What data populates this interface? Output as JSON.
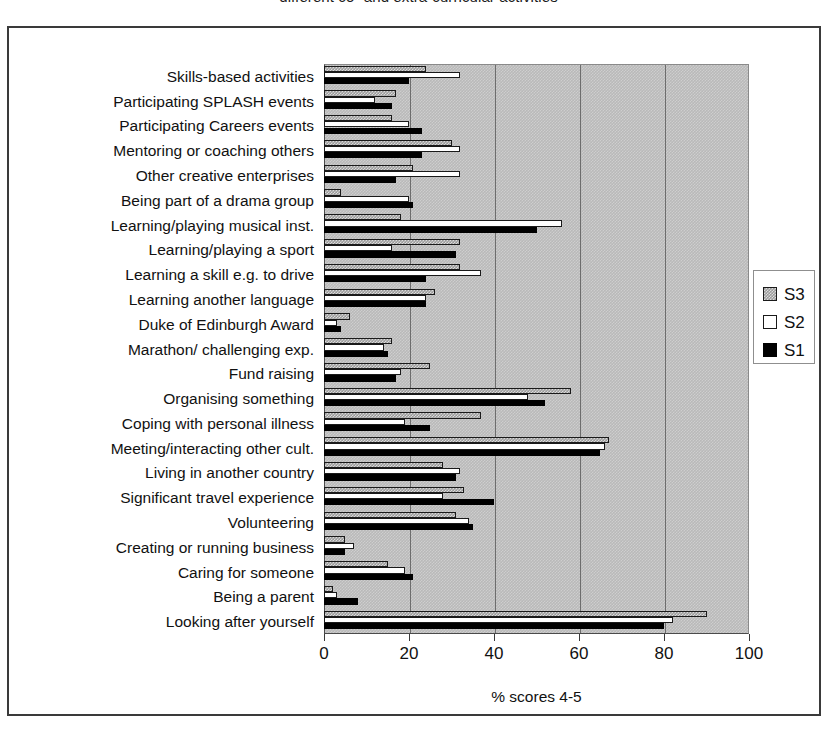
{
  "figure": {
    "title": "different co- and extra-curricular activities"
  },
  "chart_data": {
    "type": "bar",
    "orientation": "horizontal",
    "title": "different co- and extra-curricular activities",
    "xlabel": "% scores 4-5",
    "ylabel": "",
    "xlim": [
      0,
      100
    ],
    "xticks": [
      0,
      20,
      40,
      60,
      80,
      100
    ],
    "grid": "vertical gridlines at 20, 40, 60, 80",
    "legend_position": "right",
    "plot_background": "#b9b9b9",
    "categories": [
      "Skills-based activities",
      "Participating SPLASH events",
      "Participating Careers events",
      "Mentoring or coaching others",
      "Other creative enterprises",
      "Being part of a drama group",
      "Learning/playing musical inst.",
      "Learning/playing a sport",
      "Learning a skill e.g. to drive",
      "Learning another language",
      "Duke of Edinburgh Award",
      "Marathon/ challenging exp.",
      "Fund raising",
      "Organising something",
      "Coping with personal illness",
      "Meeting/interacting other cult.",
      "Living in another country",
      "Significant travel experience",
      "Volunteering",
      "Creating or running business",
      "Caring for someone",
      "Being a parent",
      "Looking after yourself"
    ],
    "series": [
      {
        "name": "S3",
        "color": "#9a9a9a",
        "values": [
          24,
          17,
          16,
          30,
          21,
          4,
          18,
          32,
          32,
          26,
          6,
          16,
          25,
          58,
          37,
          67,
          28,
          33,
          31,
          5,
          15,
          2,
          90
        ]
      },
      {
        "name": "S2",
        "color": "#ffffff",
        "values": [
          32,
          12,
          20,
          32,
          32,
          20,
          56,
          16,
          37,
          24,
          3,
          14,
          18,
          48,
          19,
          66,
          32,
          28,
          34,
          7,
          19,
          3,
          82
        ]
      },
      {
        "name": "S1",
        "color": "#000000",
        "values": [
          20,
          16,
          23,
          23,
          17,
          21,
          50,
          31,
          24,
          24,
          4,
          15,
          17,
          52,
          25,
          65,
          31,
          40,
          35,
          5,
          21,
          8,
          80
        ]
      }
    ]
  },
  "axis": {
    "x_tick_labels": [
      "0",
      "20",
      "40",
      "60",
      "80",
      "100"
    ],
    "x_title": "% scores 4-5"
  },
  "legend": {
    "entries": [
      {
        "label": "S3",
        "swatch": "gray-dotted-swatch"
      },
      {
        "label": "S2",
        "swatch": "white-swatch"
      },
      {
        "label": "S1",
        "swatch": "black-swatch"
      }
    ]
  }
}
